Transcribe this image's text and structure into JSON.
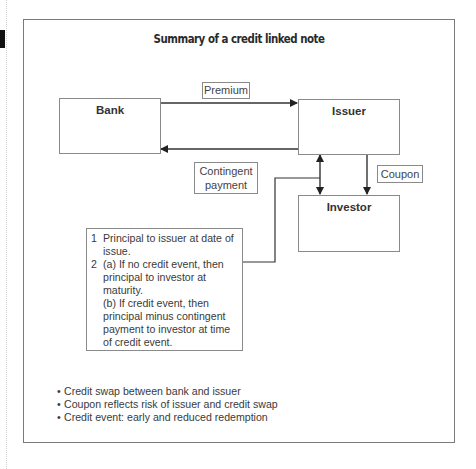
{
  "title": "Summary of a credit linked note",
  "entities": {
    "bank": "Bank",
    "issuer": "Issuer",
    "investor": "Investor"
  },
  "flows": {
    "premium": "Premium",
    "contingent_payment_line1": "Contingent",
    "contingent_payment_line2": "payment",
    "coupon": "Coupon"
  },
  "steps": [
    {
      "num": "1",
      "lines": [
        "Principal to issuer at date of issue."
      ]
    },
    {
      "num": "2",
      "lines": [
        "(a) If no credit event, then principal to investor at maturity.",
        "(b) If credit event, then principal minus contingent payment to investor at time of credit event."
      ]
    }
  ],
  "bullets": [
    "Credit swap between bank and issuer",
    "Coupon reflects risk of issuer and credit swap",
    "Credit event: early and reduced redemption"
  ],
  "bullet_symbol": "•"
}
